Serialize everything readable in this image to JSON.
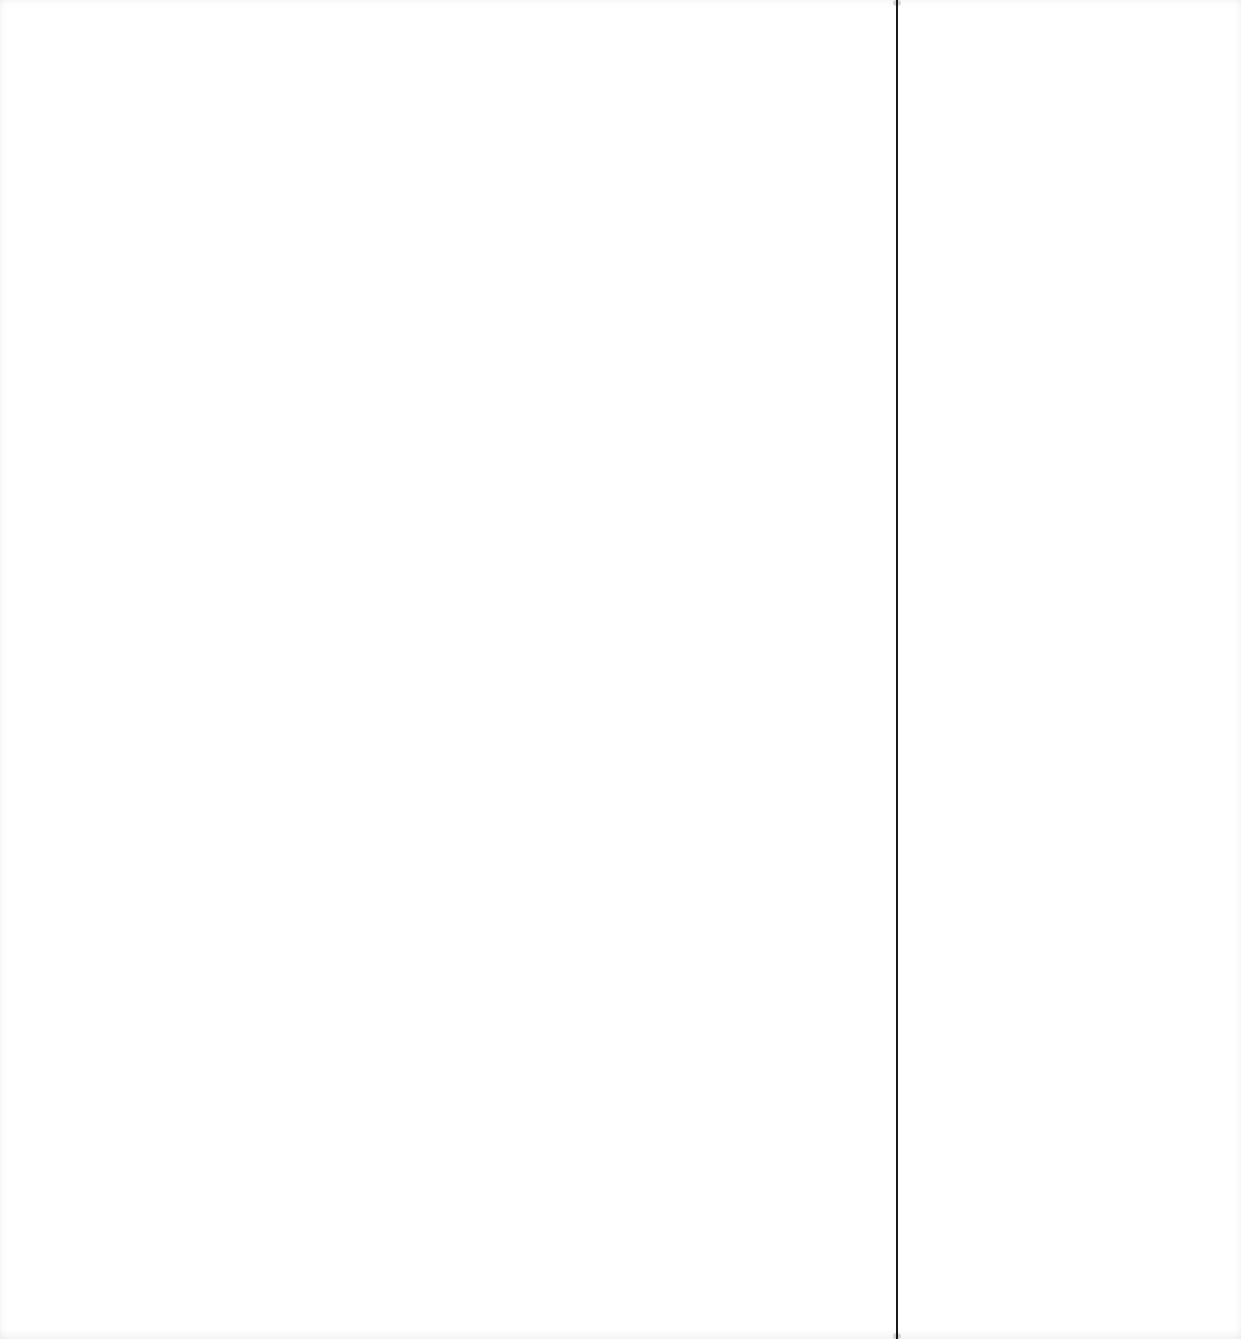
{
  "document": {
    "background_color": "#ffffff",
    "rule": {
      "orientation": "vertical",
      "x": 897,
      "color": "#1a1a1a"
    }
  }
}
